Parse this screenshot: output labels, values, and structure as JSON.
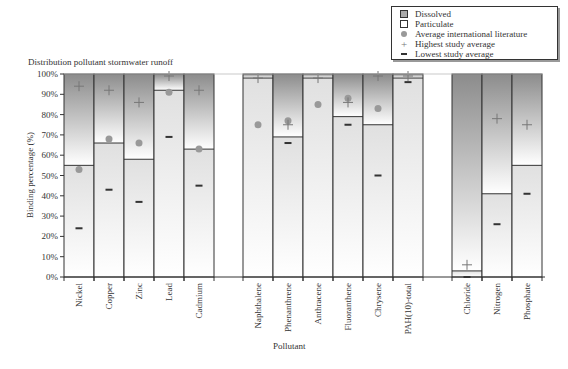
{
  "chart_data": {
    "type": "bar",
    "title": "Distribution pollutant stormwater runoff",
    "xlabel": "Pollutant",
    "ylabel": "Binding percentage (%)",
    "ylim": [
      0,
      100
    ],
    "yticks": [
      "0%",
      "10%",
      "20%",
      "30%",
      "40%",
      "50%",
      "60%",
      "70%",
      "80%",
      "90%",
      "100%"
    ],
    "stacked": true,
    "groups": [
      [
        "Nickel",
        "Copper",
        "Zinc",
        "Lead",
        "Cadmium"
      ],
      [
        "Naphthalene",
        "Phenanthrene",
        "Anthracene",
        "Fluoranthene",
        "Chrysene",
        "PAH(10)-total"
      ],
      [
        "Chloride",
        "Nitrogen",
        "Phosphate"
      ]
    ],
    "categories": [
      "Nickel",
      "Copper",
      "Zinc",
      "Lead",
      "Cadmium",
      "Naphthalene",
      "Phenanthrene",
      "Anthracene",
      "Fluoranthene",
      "Chrysene",
      "PAH(10)-total",
      "Chloride",
      "Nitrogen",
      "Phosphate"
    ],
    "series": [
      {
        "name": "Particulate",
        "values": [
          55,
          66,
          58,
          92,
          63,
          98,
          69,
          98,
          79,
          75,
          98,
          3,
          41,
          55
        ]
      },
      {
        "name": "Dissolved",
        "values": [
          45,
          34,
          42,
          8,
          37,
          2,
          31,
          2,
          21,
          25,
          2,
          97,
          59,
          45
        ]
      },
      {
        "name": "Average international literature",
        "values": [
          53,
          68,
          66,
          91,
          63,
          75,
          77,
          85,
          88,
          83,
          null,
          null,
          null,
          null
        ]
      },
      {
        "name": "Highest study average",
        "values": [
          94,
          92,
          86,
          99,
          92,
          98,
          75,
          98,
          86,
          99,
          99,
          6,
          78,
          75
        ]
      },
      {
        "name": "Lowest study average",
        "values": [
          24,
          43,
          37,
          69,
          45,
          null,
          66,
          null,
          75,
          50,
          96,
          0,
          26,
          41
        ]
      }
    ],
    "legend": [
      "Dissolved",
      "Particulate",
      "Average international literature",
      "Highest study average",
      "Lowest study average"
    ],
    "legend_position": "top-right",
    "grid": false
  },
  "legend_labels": [
    "Dissolved",
    "Particulate",
    "Average international literature",
    "Highest study average",
    "Lowest study average"
  ],
  "colors": {
    "dissolved_top": "#8c8c8c",
    "particulate": "#e6e6e6",
    "marker_circle": "#999999",
    "outline": "#333333"
  }
}
